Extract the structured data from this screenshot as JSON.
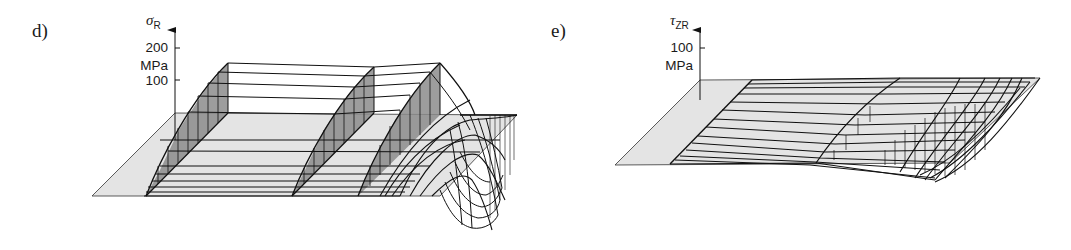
{
  "figure": {
    "panels": [
      {
        "id": "d",
        "label": "d)",
        "axis_symbol": "σ",
        "axis_subscript": "R",
        "ticks": [
          "200",
          "MPa",
          "100"
        ]
      },
      {
        "id": "e",
        "label": "e)",
        "axis_symbol": "τ",
        "axis_subscript": "ZR",
        "ticks": [
          "100",
          "MPa"
        ]
      }
    ],
    "colors": {
      "line": "#111111",
      "plane": "#e4e4e4",
      "shade": "#8c8c8c",
      "background": "#ffffff"
    }
  }
}
